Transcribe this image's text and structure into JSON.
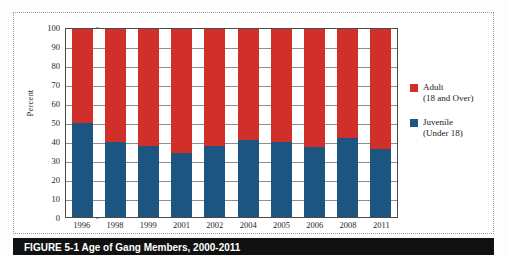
{
  "chart_data": {
    "type": "bar",
    "title": "",
    "xlabel": "",
    "ylabel": "Percent",
    "ylim": [
      0,
      100
    ],
    "yticks": [
      100,
      90,
      80,
      70,
      60,
      50,
      40,
      30,
      20,
      10,
      0
    ],
    "grid": true,
    "stacked": true,
    "legend_position": "right",
    "categories": [
      "1996",
      "1998",
      "1999",
      "2001",
      "2002",
      "2004",
      "2005",
      "2006",
      "2008",
      "2011"
    ],
    "series": [
      {
        "name": "Adult (18 and Over)",
        "color": "#d1302a",
        "values": [
          50,
          60,
          62,
          66,
          62,
          59,
          60,
          63,
          58,
          64
        ]
      },
      {
        "name": "Juvenile (Under 18)",
        "color": "#1c5680",
        "values": [
          50,
          40,
          38,
          34,
          38,
          41,
          40,
          37,
          42,
          36
        ]
      }
    ]
  },
  "legend": {
    "entries": [
      {
        "label": "Adult",
        "sublabel": "(18 and Over)",
        "color": "#d1302a",
        "swatch_name": "adult"
      },
      {
        "label": "Juvenile",
        "sublabel": "(Under 18)",
        "color": "#1c5680",
        "swatch_name": "juvenile"
      }
    ]
  },
  "caption": {
    "text": "FIGURE 5-1   Age of Gang Members, 2000-2011"
  },
  "colors": {
    "adult": "#d1302a",
    "juvenile": "#1c5680",
    "axis": "#4a4a4a",
    "grid": "#8e8e8e",
    "caption_band": "#111111"
  }
}
